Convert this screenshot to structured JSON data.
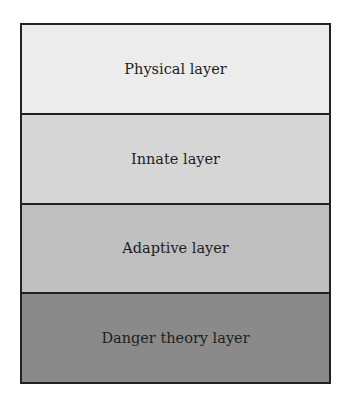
{
  "diagram": {
    "type": "layer-stack",
    "layers": [
      {
        "label": "Physical layer",
        "fill": "#ececec"
      },
      {
        "label": "Innate layer",
        "fill": "#d6d6d6"
      },
      {
        "label": "Adaptive layer",
        "fill": "#bfbfbf"
      },
      {
        "label": "Danger theory layer",
        "fill": "#8a8a8a"
      }
    ],
    "border_color": "#222222"
  }
}
